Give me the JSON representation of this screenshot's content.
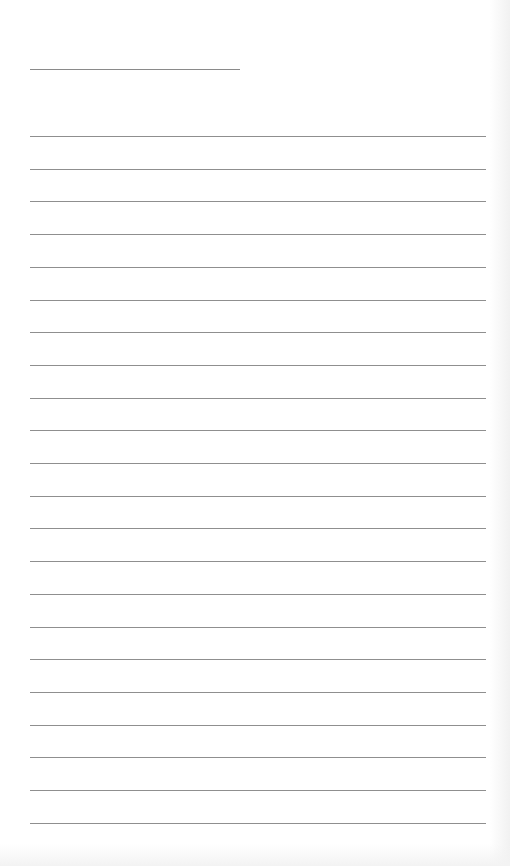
{
  "document": {
    "type": "lined-paper",
    "header_line": {
      "label": "",
      "y": 69,
      "x": 30,
      "width": 210
    },
    "rules": {
      "count": 22,
      "first_y": 136,
      "spacing": 32.7,
      "x": 30,
      "width": 456,
      "color": "#8f8f8f"
    }
  }
}
